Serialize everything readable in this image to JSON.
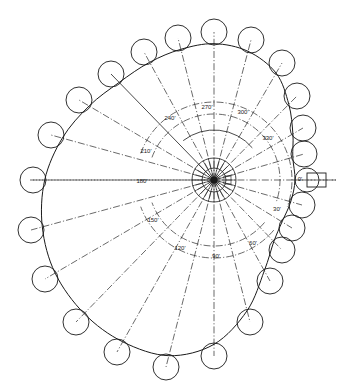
{
  "diagram": {
    "colors": {
      "line": "#1a1a1a",
      "background": "#ffffff"
    },
    "center": {
      "x": 214,
      "y": 180
    },
    "radial_lines": {
      "angles_deg": [
        0,
        15,
        30,
        45,
        60,
        75,
        90,
        105,
        120,
        135,
        150,
        165,
        180,
        195,
        210,
        225,
        240,
        255,
        270,
        285,
        300,
        315,
        330,
        345
      ],
      "length_to_profile": true
    },
    "angle_labels": [
      {
        "text": "0'",
        "x": 300,
        "y": 181
      },
      {
        "text": "30'",
        "x": 277,
        "y": 211
      },
      {
        "text": "60'",
        "x": 253,
        "y": 245
      },
      {
        "text": "90'",
        "x": 216,
        "y": 258
      },
      {
        "text": "120'",
        "x": 180,
        "y": 250
      },
      {
        "text": "150'",
        "x": 153,
        "y": 222
      },
      {
        "text": "180'",
        "x": 142,
        "y": 183
      },
      {
        "text": "210'",
        "x": 146,
        "y": 153
      },
      {
        "text": "240'",
        "x": 170,
        "y": 120
      },
      {
        "text": "270'",
        "x": 207,
        "y": 109
      },
      {
        "text": "300'",
        "x": 243,
        "y": 114
      },
      {
        "text": "330'",
        "x": 268,
        "y": 140
      }
    ],
    "label_arcs": [
      {
        "name": "outer-label-arc",
        "r": 78
      },
      {
        "name": "inner-label-arc",
        "r": 66
      }
    ],
    "hub": {
      "outer_r": 22,
      "inner_r": 12,
      "base_arc_r": 50
    },
    "follower": {
      "roller": {
        "x": 307,
        "y": 180,
        "r": 12
      },
      "stem": {
        "x": 307,
        "y": 173,
        "w": 19,
        "h": 14
      }
    },
    "rollers": [
      {
        "x": 214,
        "y": 32
      },
      {
        "x": 251,
        "y": 40
      },
      {
        "x": 282,
        "y": 63
      },
      {
        "x": 297,
        "y": 96
      },
      {
        "x": 303,
        "y": 128
      },
      {
        "x": 304,
        "y": 154
      },
      {
        "x": 302,
        "y": 205
      },
      {
        "x": 292,
        "y": 228
      },
      {
        "x": 282,
        "y": 250
      },
      {
        "x": 270,
        "y": 281
      },
      {
        "x": 250,
        "y": 322
      },
      {
        "x": 214,
        "y": 356
      },
      {
        "x": 166,
        "y": 367
      },
      {
        "x": 117,
        "y": 352
      },
      {
        "x": 76,
        "y": 322
      },
      {
        "x": 45,
        "y": 279
      },
      {
        "x": 31,
        "y": 230
      },
      {
        "x": 33,
        "y": 180
      },
      {
        "x": 51,
        "y": 135
      },
      {
        "x": 79,
        "y": 100
      },
      {
        "x": 111,
        "y": 74
      },
      {
        "x": 144,
        "y": 52
      },
      {
        "x": 178,
        "y": 38
      }
    ],
    "roller_radius": 13
  }
}
